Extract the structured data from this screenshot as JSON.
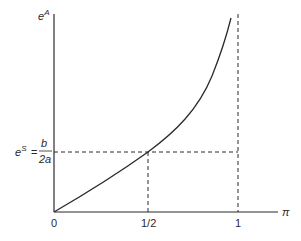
{
  "diagram": {
    "y_axis": {
      "label_base": "e",
      "label_sup": "A"
    },
    "x_axis": {
      "label": "π",
      "ticks": [
        {
          "label": "0",
          "value": 0
        },
        {
          "label": "1/2",
          "value": 0.5
        },
        {
          "label": "1",
          "value": 1
        }
      ]
    },
    "reference_level": {
      "lhs_base": "e",
      "lhs_sup": "S",
      "equals": "=",
      "numerator": "b",
      "denominator": "2a"
    },
    "curve": {
      "description": "convex increasing curve from origin, crossing e^S at π=1/2, diverging as π→1"
    },
    "colors": {
      "line": "#2a2a2a",
      "dashed": "#2a2a2a",
      "background": "#ffffff"
    }
  }
}
